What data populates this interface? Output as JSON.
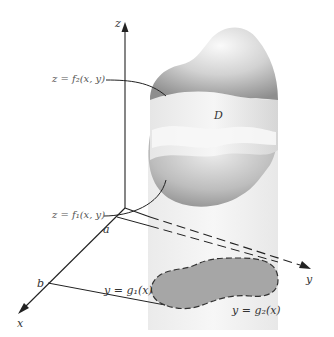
{
  "figure": {
    "axes": {
      "z_label": "z",
      "y_label": "y",
      "x_label": "x"
    },
    "points": {
      "a": "a",
      "b": "b"
    },
    "region_label": "D",
    "surfaces": {
      "upper": "z = f₂(x, y)",
      "lower": "z = f₁(x, y)"
    },
    "boundaries": {
      "lower_curve": "y = g₁(x)",
      "upper_curve": "y = g₂(x)"
    },
    "colors": {
      "solid_light": "#f2f2f2",
      "solid_mid": "#c8c8c8",
      "solid_dark": "#8a8a8a",
      "cylinder": "#ececec",
      "region_fill": "#a6a6a6",
      "axis": "#222222"
    }
  }
}
